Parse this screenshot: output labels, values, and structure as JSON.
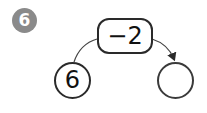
{
  "problem": {
    "number": "6",
    "operation": "−2",
    "input_value": "6",
    "output_value": ""
  },
  "colors": {
    "badge_bg": "#8a8a8a",
    "stroke": "#2a2a2a"
  }
}
